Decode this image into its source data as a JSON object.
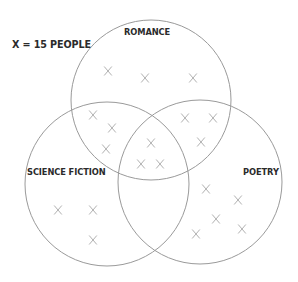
{
  "legend": {
    "text": "X = 15 PEOPLE",
    "x": 12,
    "y": 45
  },
  "colors": {
    "circle_stroke": "#9a9a9a",
    "mark_stroke": "#a8a8a8",
    "label": "#2b2b2b",
    "background": "#ffffff"
  },
  "sets": [
    {
      "id": "romance",
      "label": "ROMANCE",
      "cx": 151,
      "cy": 100,
      "r": 80,
      "label_x": 124,
      "label_y": 33
    },
    {
      "id": "science-fiction",
      "label": "SCIENCE FICTION",
      "cx": 107,
      "cy": 184,
      "r": 82,
      "label_x": 27,
      "label_y": 173
    },
    {
      "id": "poetry",
      "label": "POETRY",
      "cx": 200,
      "cy": 182,
      "r": 82,
      "label_x": 243,
      "label_y": 173
    }
  ],
  "marks": [
    {
      "region": "romance-only",
      "x": 108,
      "y": 71
    },
    {
      "region": "romance-only",
      "x": 145,
      "y": 78
    },
    {
      "region": "romance-only",
      "x": 193,
      "y": 78
    },
    {
      "region": "romance-scifi",
      "x": 93,
      "y": 115
    },
    {
      "region": "romance-scifi",
      "x": 112,
      "y": 128
    },
    {
      "region": "romance-scifi",
      "x": 106,
      "y": 149
    },
    {
      "region": "romance-poetry",
      "x": 185,
      "y": 118
    },
    {
      "region": "romance-poetry",
      "x": 213,
      "y": 118
    },
    {
      "region": "romance-poetry",
      "x": 201,
      "y": 142
    },
    {
      "region": "all-three",
      "x": 151,
      "y": 143
    },
    {
      "region": "all-three",
      "x": 141,
      "y": 164
    },
    {
      "region": "all-three",
      "x": 160,
      "y": 164
    },
    {
      "region": "scifi-only",
      "x": 58,
      "y": 210
    },
    {
      "region": "scifi-only",
      "x": 93,
      "y": 210
    },
    {
      "region": "scifi-only",
      "x": 93,
      "y": 240
    },
    {
      "region": "poetry-only",
      "x": 206,
      "y": 189
    },
    {
      "region": "poetry-only",
      "x": 238,
      "y": 200
    },
    {
      "region": "poetry-only",
      "x": 216,
      "y": 219
    },
    {
      "region": "poetry-only",
      "x": 196,
      "y": 234
    },
    {
      "region": "poetry-only",
      "x": 242,
      "y": 229
    }
  ],
  "region_counts": {
    "romance_only": 3,
    "romance_and_science_fiction": 3,
    "romance_and_poetry": 3,
    "all_three": 3,
    "science_fiction_only": 3,
    "poetry_only": 5
  }
}
